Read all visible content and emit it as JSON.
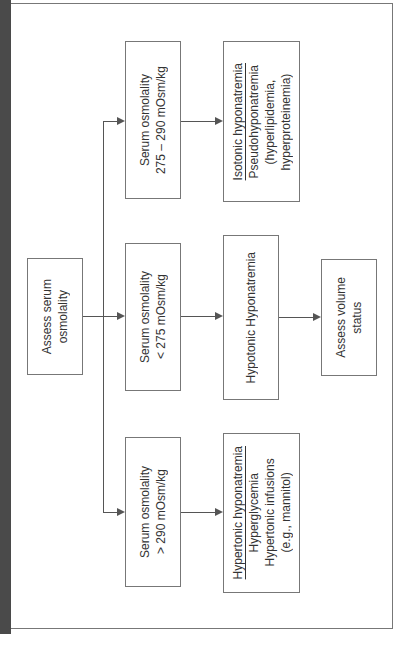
{
  "diagram": {
    "orientation": "rotated 90° counter-clockwise",
    "root": {
      "lines": [
        "Assess serum",
        "osmolality"
      ]
    },
    "branches": [
      {
        "condition": {
          "lines": [
            "Serum osmolality",
            "275 – 290 mOsm/kg"
          ]
        },
        "result": {
          "title": "Isotonic hyponatremia",
          "lines": [
            "Pseudohyponatremia",
            "(hyperlipidemia,",
            "hyperproteinemia)"
          ]
        }
      },
      {
        "condition": {
          "lines": [
            "Serum osmolality",
            "< 275 mOsm/kg"
          ]
        },
        "result": {
          "title": "",
          "lines": [
            "Hypotonic Hyponatremia"
          ]
        },
        "next": {
          "lines": [
            "Assess volume",
            "status"
          ]
        }
      },
      {
        "condition": {
          "lines": [
            "Serum osmolality",
            "> 290 mOsm/kg"
          ]
        },
        "result": {
          "title": "Hypertonic hyponatremia",
          "lines": [
            "Hyperglycemia",
            "Hypertonic infusions",
            "(e.g., mannitol)"
          ]
        }
      }
    ]
  },
  "colors": {
    "border": "#777777",
    "line": "#555555",
    "strip": "#4a4a4a",
    "text": "#333333"
  }
}
